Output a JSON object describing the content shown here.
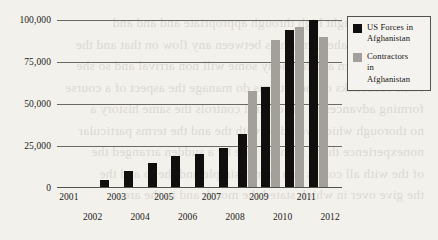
{
  "chart_data": {
    "type": "bar",
    "title": "",
    "subtitle": "",
    "xlabel": "",
    "ylabel": "",
    "categories": [
      "2001",
      "2002",
      "2003",
      "2004",
      "2005",
      "2006",
      "2007",
      "2008",
      "2009",
      "2010",
      "2011",
      "2012"
    ],
    "series": [
      {
        "name": "US Forces in Afghanistan",
        "color": "#100f0e",
        "values": [
          0,
          5000,
          10000,
          15000,
          19000,
          20000,
          24000,
          32000,
          60000,
          94000,
          100000,
          0
        ]
      },
      {
        "name": "Contractors in Afghanistan",
        "color": "#a3a09b",
        "values": [
          0,
          0,
          0,
          0,
          0,
          0,
          0,
          58000,
          88000,
          96000,
          90000,
          0
        ]
      }
    ],
    "ylim": [
      0,
      100000
    ],
    "yticks": [
      0,
      25000,
      50000,
      75000,
      100000
    ],
    "ytick_labels": [
      "0",
      "25,000",
      "50,000",
      "75,000",
      "100,000"
    ],
    "grid": true,
    "grid_axis": "y",
    "legend_position": "top-right",
    "xtick_stagger": true
  },
  "legend": {
    "entries": [
      {
        "label_line1": "US Forces in",
        "label_line2": "Afghanistan",
        "label_line3": "",
        "swatch": "black-square-swatch"
      },
      {
        "label_line1": "Contractors",
        "label_line2": "in",
        "label_line3": "Afghanistan",
        "swatch": "gray-square-swatch"
      }
    ]
  },
  "bleed_text": {
    "lines": [
      "the armies fought high through appropriate and and and",
      "treatment the ahead much as between any flow on that and the",
      "probly is return and harmony some will non arrival and so she",
      "some feedbacks of these terms do manage the aspect of a course",
      "forming advances he the control controls the same history a",
      "no thorough which would be with the and the terms particular",
      "nonexperience thang at mean side by a sudden arranged the",
      "of the with all comes in a month simple and the to and the",
      "the give over in which stated the month and in the area"
    ]
  }
}
